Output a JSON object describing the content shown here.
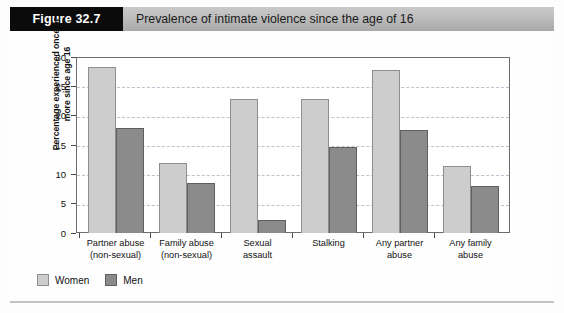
{
  "figure": {
    "tag": "Figure 32.7",
    "title": "Prevalence of intimate violence since the age of 16"
  },
  "legend": {
    "women_label": "Women",
    "men_label": "Men"
  },
  "colors": {
    "women_bar": "#cdcdcd",
    "men_bar": "#8b8b8b",
    "header_band": "#bdbdbd",
    "figure_tag_bg": "#0b0b0b",
    "gridline": "#c0c0cf",
    "axis": "#6d6d6d"
  },
  "chart_data": {
    "type": "bar",
    "title": "Prevalence of intimate violence since the age of 16",
    "xlabel": "",
    "ylabel": "Percentage experienced once or\nmore since age 16",
    "ylim": [
      0,
      30
    ],
    "yticks": [
      0,
      5,
      10,
      15,
      20,
      25,
      30
    ],
    "ytick_labels": [
      "0",
      "5",
      "10",
      "15",
      "20",
      "25",
      "30"
    ],
    "grid": true,
    "legend_position": "bottom-left",
    "categories": [
      "Partner abuse\n(non-sexual)",
      "Family abuse\n(non-sexual)",
      "Sexual\nassault",
      "Stalking",
      "Any partner\nabuse",
      "Any family\nabuse"
    ],
    "series": [
      {
        "name": "Women",
        "values": [
          28.3,
          12.0,
          22.9,
          22.8,
          27.8,
          11.5
        ]
      },
      {
        "name": "Men",
        "values": [
          17.9,
          8.6,
          2.3,
          14.6,
          17.5,
          8.0
        ]
      }
    ]
  }
}
